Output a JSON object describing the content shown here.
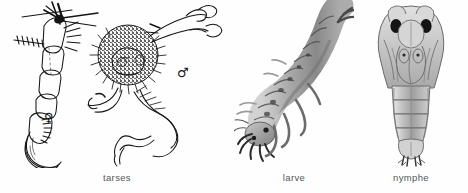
{
  "figure": {
    "kind": "entomological-plate",
    "background_color": "#fefefe",
    "ink_color": "#1b1b1b",
    "caption_color": "#55585c",
    "width": 468,
    "height": 193
  },
  "panels": [
    {
      "id": "tarses",
      "caption": "tarses",
      "style": "black-line-drawing",
      "subjects": [
        {
          "id": "female-tarsus",
          "sex_symbol": "♀",
          "sex_name": "female",
          "features": "segmented tarsus with setae rows and paired curved claws"
        },
        {
          "id": "male-tarsus",
          "sex_symbol": "♂",
          "sex_name": "male",
          "features": "dense stippled pad with radiating bristles and hooked claw"
        }
      ]
    },
    {
      "id": "larve",
      "caption": "larve",
      "style": "grey-wash-drawing",
      "subjects": [
        {
          "id": "larva",
          "features": "curved segmented body, bristled head appendages, forked terminal segment"
        }
      ]
    },
    {
      "id": "nymphe",
      "caption": "nymphe",
      "style": "grey-wash-drawing",
      "subjects": [
        {
          "id": "pupa",
          "features": "dorsal view pupa with two dark eyes, wing pads, segmented abdomen, terminal paddles"
        }
      ]
    }
  ]
}
